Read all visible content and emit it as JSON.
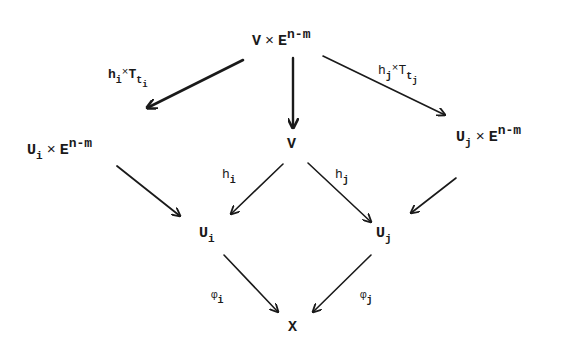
{
  "diagram": {
    "type": "commutative-diagram",
    "colors": {
      "ink": "#1a1a1a",
      "background": "#ffffff"
    },
    "nodes": {
      "top": {
        "base": "V",
        "times": "×",
        "space": "E",
        "exp": "n-m"
      },
      "left_product": {
        "base": "U",
        "base_sub": "i",
        "times": "×",
        "space": "E",
        "exp": "n-m"
      },
      "center": {
        "base": "V"
      },
      "right_product": {
        "base": "U",
        "base_sub": "j",
        "times": "×",
        "space": "E",
        "exp": "n-m"
      },
      "ui": {
        "base": "U",
        "sub": "i"
      },
      "uj": {
        "base": "U",
        "sub": "j"
      },
      "x": {
        "base": "X"
      }
    },
    "arrows": [
      {
        "from": "V × E^(n-m)",
        "to": "U_i × E^(n-m)",
        "label": {
          "h": "h",
          "h_sub": "i",
          "times": "×",
          "T": "T",
          "T_sub": "t",
          "T_subsub": "i"
        }
      },
      {
        "from": "V × E^(n-m)",
        "to": "V",
        "label": null
      },
      {
        "from": "V × E^(n-m)",
        "to": "U_j × E^(n-m)",
        "label": {
          "h": "h",
          "h_sub": "j",
          "times": "×",
          "T": "T",
          "T_sub": "t",
          "T_subsub": "j"
        }
      },
      {
        "from": "V",
        "to": "U_i",
        "label": {
          "base": "h",
          "sub": "i"
        }
      },
      {
        "from": "V",
        "to": "U_j",
        "label": {
          "base": "h",
          "sub": "j"
        }
      },
      {
        "from": "U_i × E^(n-m)",
        "to": "U_i",
        "label": null
      },
      {
        "from": "U_j × E^(n-m)",
        "to": "U_j",
        "label": null
      },
      {
        "from": "U_i",
        "to": "X",
        "label": {
          "base": "φ",
          "sub": "i"
        }
      },
      {
        "from": "U_j",
        "to": "X",
        "label": {
          "base": "φ",
          "sub": "j"
        }
      }
    ]
  }
}
